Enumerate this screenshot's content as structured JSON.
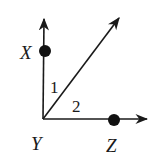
{
  "diagram": {
    "type": "geometry-angles",
    "points": {
      "X": {
        "label": "X"
      },
      "Y": {
        "label": "Y"
      },
      "Z": {
        "label": "Z"
      }
    },
    "angles": {
      "angle1": {
        "label": "1"
      },
      "angle2": {
        "label": "2"
      }
    },
    "rays": [
      "YX (vertical, upward)",
      "Y diagonal (45°)",
      "YZ (horizontal, right)"
    ],
    "colors": {
      "stroke": "#1a1a1a",
      "background": "#ffffff"
    }
  }
}
